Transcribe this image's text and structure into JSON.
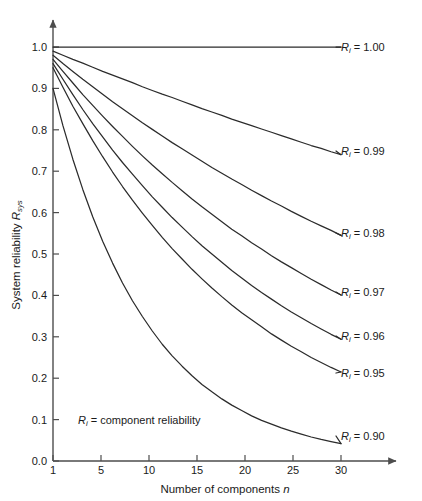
{
  "chart_data": {
    "type": "line",
    "title": "",
    "subtitle": "",
    "xlabel_prefix": "Number of components ",
    "xlabel_italic": "n",
    "ylabel_prefix": "System reliability ",
    "ylabel_italic": "R",
    "ylabel_sub": "sys",
    "xlim": [
      1,
      30
    ],
    "ylim": [
      0.0,
      1.0
    ],
    "grid": false,
    "legend_position": "inline-right-of-curve-ends",
    "annotation": {
      "italic": "R",
      "sub": "i",
      "text": " = component reliability"
    },
    "xticks": [
      1,
      5,
      10,
      15,
      20,
      25,
      30
    ],
    "xtick_labels": [
      "1",
      "5",
      "10",
      "15",
      "20",
      "25",
      "30"
    ],
    "yticks": [
      0.0,
      0.1,
      0.2,
      0.3,
      0.4,
      0.5,
      0.6,
      0.7,
      0.8,
      0.9,
      1.0
    ],
    "ytick_labels": [
      "0.0",
      "0.1",
      "0.2",
      "0.3",
      "0.4",
      "0.5",
      "0.6",
      "0.7",
      "0.8",
      "0.9",
      "1.0"
    ],
    "formula": "R_sys = R_i^n",
    "x": [
      1,
      2,
      3,
      4,
      5,
      6,
      7,
      8,
      9,
      10,
      11,
      12,
      13,
      14,
      15,
      16,
      17,
      18,
      19,
      20,
      21,
      22,
      23,
      24,
      25,
      26,
      27,
      28,
      29,
      30
    ],
    "series": [
      {
        "name": "Ri = 1.00",
        "label_italic": "R",
        "label_sub": "i",
        "label_text": " = 1.00",
        "ri": 1.0,
        "color": "#2b2b2b",
        "values": [
          1.0,
          1.0,
          1.0,
          1.0,
          1.0,
          1.0,
          1.0,
          1.0,
          1.0,
          1.0,
          1.0,
          1.0,
          1.0,
          1.0,
          1.0,
          1.0,
          1.0,
          1.0,
          1.0,
          1.0,
          1.0,
          1.0,
          1.0,
          1.0,
          1.0,
          1.0,
          1.0,
          1.0,
          1.0,
          1.0
        ]
      },
      {
        "name": "Ri = 0.99",
        "label_italic": "R",
        "label_sub": "i",
        "label_text": " = 0.99",
        "ri": 0.99,
        "color": "#2b2b2b",
        "values": [
          0.99,
          0.98,
          0.97,
          0.961,
          0.951,
          0.941,
          0.932,
          0.923,
          0.914,
          0.904,
          0.895,
          0.886,
          0.878,
          0.869,
          0.86,
          0.851,
          0.843,
          0.835,
          0.826,
          0.818,
          0.81,
          0.802,
          0.794,
          0.786,
          0.778,
          0.77,
          0.762,
          0.755,
          0.747,
          0.74
        ]
      },
      {
        "name": "Ri = 0.98",
        "label_italic": "R",
        "label_sub": "i",
        "label_text": " = 0.98",
        "ri": 0.98,
        "color": "#2b2b2b",
        "values": [
          0.98,
          0.96,
          0.941,
          0.922,
          0.904,
          0.886,
          0.868,
          0.851,
          0.834,
          0.817,
          0.801,
          0.785,
          0.769,
          0.754,
          0.739,
          0.724,
          0.709,
          0.695,
          0.681,
          0.668,
          0.654,
          0.641,
          0.628,
          0.616,
          0.603,
          0.591,
          0.579,
          0.568,
          0.557,
          0.545
        ]
      },
      {
        "name": "Ri = 0.97",
        "label_italic": "R",
        "label_sub": "i",
        "label_text": " = 0.97",
        "ri": 0.97,
        "color": "#2b2b2b",
        "values": [
          0.97,
          0.941,
          0.913,
          0.885,
          0.859,
          0.833,
          0.808,
          0.784,
          0.76,
          0.737,
          0.715,
          0.694,
          0.673,
          0.653,
          0.633,
          0.614,
          0.596,
          0.578,
          0.56,
          0.544,
          0.527,
          0.512,
          0.496,
          0.481,
          0.467,
          0.453,
          0.439,
          0.426,
          0.413,
          0.401
        ]
      },
      {
        "name": "Ri = 0.96",
        "label_italic": "R",
        "label_sub": "i",
        "label_text": " = 0.96",
        "ri": 0.96,
        "color": "#2b2b2b",
        "values": [
          0.96,
          0.922,
          0.885,
          0.849,
          0.815,
          0.783,
          0.751,
          0.721,
          0.693,
          0.665,
          0.638,
          0.613,
          0.588,
          0.565,
          0.542,
          0.52,
          0.5,
          0.48,
          0.46,
          0.442,
          0.424,
          0.407,
          0.391,
          0.375,
          0.36,
          0.346,
          0.332,
          0.319,
          0.306,
          0.294
        ]
      },
      {
        "name": "Ri = 0.95",
        "label_italic": "R",
        "label_sub": "i",
        "label_text": " = 0.95",
        "ri": 0.95,
        "color": "#2b2b2b",
        "values": [
          0.95,
          0.903,
          0.857,
          0.815,
          0.774,
          0.735,
          0.698,
          0.663,
          0.63,
          0.599,
          0.569,
          0.54,
          0.513,
          0.488,
          0.463,
          0.44,
          0.418,
          0.397,
          0.377,
          0.358,
          0.341,
          0.324,
          0.307,
          0.292,
          0.277,
          0.264,
          0.25,
          0.238,
          0.226,
          0.215
        ]
      },
      {
        "name": "Ri = 0.90",
        "label_italic": "R",
        "label_sub": "i",
        "label_text": " = 0.90",
        "ri": 0.9,
        "color": "#2b2b2b",
        "values": [
          0.9,
          0.81,
          0.729,
          0.656,
          0.59,
          0.531,
          0.478,
          0.43,
          0.387,
          0.349,
          0.314,
          0.282,
          0.254,
          0.229,
          0.206,
          0.185,
          0.167,
          0.15,
          0.135,
          0.122,
          0.109,
          0.098,
          0.089,
          0.08,
          0.072,
          0.065,
          0.058,
          0.052,
          0.047,
          0.042
        ]
      }
    ]
  },
  "axis": {
    "y_arrow": "y-axis-arrow",
    "x_arrow": "x-axis-arrow"
  }
}
